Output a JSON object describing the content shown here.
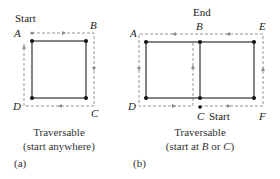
{
  "panel_a": {
    "start_label": "Start",
    "vertices": {
      "A": "A",
      "B": "B",
      "C": "C",
      "D": "D"
    },
    "caption_line1": "Traversable",
    "caption_line2": "(start anywhere)",
    "panel_label": "(a)"
  },
  "panel_b": {
    "end_label": "End",
    "start_label": "Start",
    "vertices": {
      "A": "A",
      "B": "B",
      "C": "C",
      "D": "D",
      "E": "E",
      "F": "F"
    },
    "caption_line1": "Traversable",
    "caption_line2_prefix": "(start at ",
    "caption_line2_b": "B",
    "caption_line2_or": " or ",
    "caption_line2_c": "C",
    "caption_line2_suffix": ")",
    "panel_label": "(b)"
  },
  "colors": {
    "edge": "#333333",
    "path": "#8a8a8a",
    "vertex": "#111111"
  }
}
